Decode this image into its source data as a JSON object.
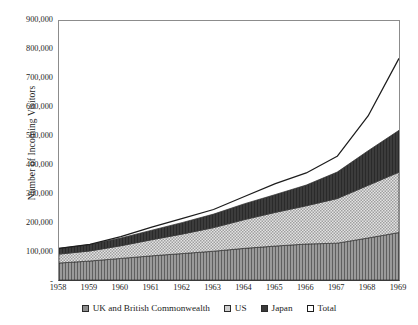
{
  "chart_data": {
    "type": "area",
    "title": "",
    "subtitle": "",
    "xlabel": "",
    "ylabel": "Number of Incoming Visitors",
    "stacked": true,
    "grid": false,
    "legend_position": "bottom",
    "ylim": [
      0,
      900000
    ],
    "ytick_step": 100000,
    "ytick_labels": [
      "900,000",
      "800,000",
      "700,000",
      "600,000",
      "500,000",
      "400,000",
      "300,000",
      "200,000",
      "100,000",
      "-"
    ],
    "ytick_values": [
      900000,
      800000,
      700000,
      600000,
      500000,
      400000,
      300000,
      200000,
      100000,
      0
    ],
    "categories": [
      "1958",
      "1959",
      "1960",
      "1961",
      "1962",
      "1963",
      "1964",
      "1965",
      "1966",
      "1967",
      "1968",
      "1969"
    ],
    "x": [
      1958,
      1959,
      1960,
      1961,
      1962,
      1963,
      1964,
      1965,
      1966,
      1967,
      1968,
      1969
    ],
    "series": [
      {
        "name": "UK and British Commonwealth",
        "color": "#8d8d8d",
        "fill": "vertical-hatch",
        "values": [
          59000,
          66000,
          75000,
          84000,
          92000,
          100000,
          110000,
          118000,
          125000,
          128000,
          146000,
          165000
        ]
      },
      {
        "name": "US",
        "color": "#cfcfcf",
        "fill": "checker",
        "values": [
          31000,
          35000,
          44000,
          56000,
          68000,
          82000,
          100000,
          117000,
          133000,
          155000,
          183000,
          210000
        ]
      },
      {
        "name": "Japan",
        "color": "#3a3a3a",
        "fill": "solid-dark",
        "values": [
          20000,
          22000,
          27000,
          33000,
          40000,
          47000,
          55000,
          62000,
          72000,
          92000,
          120000,
          145000
        ]
      }
    ],
    "total_line": {
      "name": "Total",
      "color": "#1d1d1d",
      "fill": "none",
      "values": [
        110000,
        124000,
        151000,
        184000,
        214000,
        245000,
        290000,
        335000,
        372000,
        430000,
        570000,
        770000
      ]
    },
    "annotations": []
  },
  "legend": {
    "items": [
      {
        "label": "UK and British Commonwealth",
        "swatch": "uk-swatch"
      },
      {
        "label": "US",
        "swatch": "us-swatch"
      },
      {
        "label": "Japan",
        "swatch": "japan-swatch"
      },
      {
        "label": "Total",
        "swatch": "total-swatch"
      }
    ]
  },
  "colors": {
    "uk": "#8d8d8d",
    "us": "#cfcfcf",
    "japan": "#3a3a3a",
    "total": "#1d1d1d",
    "frame": "#8c8c8c",
    "background": "#ffffff"
  }
}
